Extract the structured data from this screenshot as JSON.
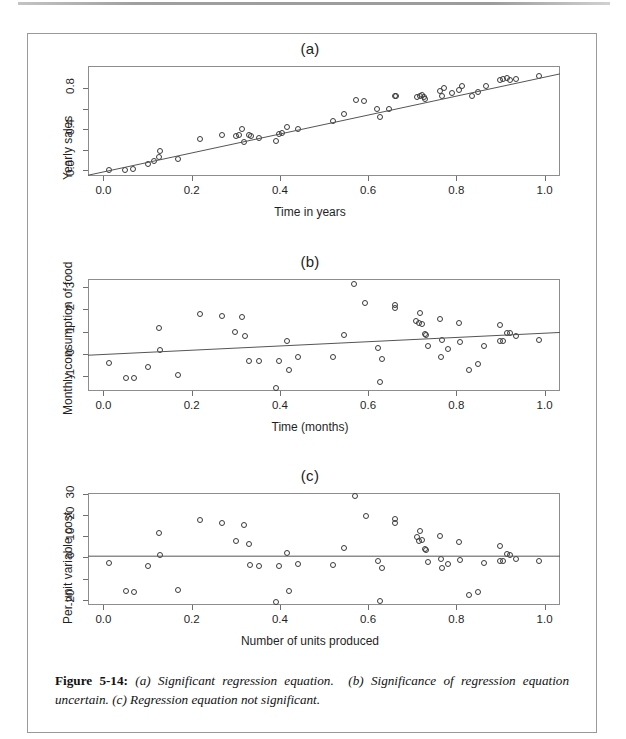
{
  "figure": {
    "caption_label": "Figure 5-14",
    "caption_sep": ":",
    "caption_a": "(a) Significant regression equation.",
    "caption_b": "(b) Significance of regression equation uncertain.",
    "caption_c": "(c) Regression equation not significant."
  },
  "chart_data": [
    {
      "type": "scatter",
      "title": "(a)",
      "xlabel": "Time in years",
      "ylabel": "Yearly sales",
      "xlim": [
        -0.035,
        1.035
      ],
      "ylim": [
        -0.06,
        1.02
      ],
      "xticks": [
        0.0,
        0.2,
        0.4,
        0.6,
        0.8,
        1.0
      ],
      "xticklabels": [
        "0.0",
        "0.2",
        "0.4",
        "0.6",
        "0.8",
        "1.0"
      ],
      "yticks": [
        0.0,
        0.4,
        0.8
      ],
      "yticklabels": [
        "0.0",
        "0.4",
        "0.8"
      ],
      "yminorticks": [
        0.2,
        0.6
      ],
      "grid": false,
      "legend": "none",
      "fit_line": {
        "intercept": -0.02,
        "slope": 0.93
      },
      "points": [
        [
          0.012,
          0.0
        ],
        [
          0.05,
          0.0
        ],
        [
          0.068,
          0.01
        ],
        [
          0.1,
          0.06
        ],
        [
          0.115,
          0.085
        ],
        [
          0.125,
          0.13
        ],
        [
          0.128,
          0.19
        ],
        [
          0.168,
          0.105
        ],
        [
          0.22,
          0.3
        ],
        [
          0.268,
          0.345
        ],
        [
          0.3,
          0.33
        ],
        [
          0.308,
          0.345
        ],
        [
          0.315,
          0.4
        ],
        [
          0.318,
          0.275
        ],
        [
          0.33,
          0.345
        ],
        [
          0.335,
          0.33
        ],
        [
          0.352,
          0.31
        ],
        [
          0.392,
          0.28
        ],
        [
          0.398,
          0.35
        ],
        [
          0.405,
          0.36
        ],
        [
          0.415,
          0.42
        ],
        [
          0.442,
          0.405
        ],
        [
          0.52,
          0.48
        ],
        [
          0.545,
          0.545
        ],
        [
          0.572,
          0.69
        ],
        [
          0.59,
          0.675
        ],
        [
          0.62,
          0.595
        ],
        [
          0.628,
          0.52
        ],
        [
          0.648,
          0.6
        ],
        [
          0.66,
          0.725
        ],
        [
          0.663,
          0.73
        ],
        [
          0.71,
          0.715
        ],
        [
          0.718,
          0.73
        ],
        [
          0.722,
          0.735
        ],
        [
          0.726,
          0.715
        ],
        [
          0.73,
          0.7
        ],
        [
          0.762,
          0.775
        ],
        [
          0.768,
          0.725
        ],
        [
          0.772,
          0.8
        ],
        [
          0.79,
          0.755
        ],
        [
          0.805,
          0.785
        ],
        [
          0.812,
          0.825
        ],
        [
          0.835,
          0.73
        ],
        [
          0.848,
          0.76
        ],
        [
          0.868,
          0.825
        ],
        [
          0.898,
          0.88
        ],
        [
          0.905,
          0.89
        ],
        [
          0.915,
          0.9
        ],
        [
          0.922,
          0.885
        ],
        [
          0.935,
          0.895
        ],
        [
          0.988,
          0.92
        ]
      ]
    },
    {
      "type": "scatter",
      "title": "(b)",
      "xlabel": "Time (months)",
      "ylabel": "Monthly consumption of food",
      "xlim": [
        -0.035,
        1.035
      ],
      "ylim": [
        -1.65,
        3.35
      ],
      "xticks": [
        0.0,
        0.2,
        0.4,
        0.6,
        0.8,
        1.0
      ],
      "xticklabels": [
        "0.0",
        "0.2",
        "0.4",
        "0.6",
        "0.8",
        "1.0"
      ],
      "yticks": [
        -1,
        0,
        1,
        2,
        3
      ],
      "yticklabels": [
        "-1",
        "0",
        "1",
        "2",
        "3"
      ],
      "grid": false,
      "legend": "none",
      "fit_line": {
        "intercept": -0.02,
        "slope": 0.95
      },
      "points": [
        [
          0.012,
          -0.42
        ],
        [
          0.052,
          -1.06
        ],
        [
          0.07,
          -1.08
        ],
        [
          0.1,
          -0.6
        ],
        [
          0.125,
          1.18
        ],
        [
          0.128,
          0.18
        ],
        [
          0.168,
          -0.92
        ],
        [
          0.22,
          1.8
        ],
        [
          0.268,
          1.72
        ],
        [
          0.298,
          0.98
        ],
        [
          0.315,
          1.66
        ],
        [
          0.322,
          0.82
        ],
        [
          0.33,
          -0.32
        ],
        [
          0.352,
          -0.32
        ],
        [
          0.392,
          -1.52
        ],
        [
          0.398,
          -0.3
        ],
        [
          0.415,
          0.56
        ],
        [
          0.42,
          -0.7
        ],
        [
          0.442,
          -0.12
        ],
        [
          0.52,
          -0.12
        ],
        [
          0.545,
          0.86
        ],
        [
          0.568,
          3.12
        ],
        [
          0.592,
          2.28
        ],
        [
          0.622,
          0.26
        ],
        [
          0.628,
          -1.24
        ],
        [
          0.632,
          -0.2
        ],
        [
          0.66,
          2.18
        ],
        [
          0.662,
          2.04
        ],
        [
          0.708,
          1.48
        ],
        [
          0.715,
          1.38
        ],
        [
          0.718,
          1.82
        ],
        [
          0.722,
          1.32
        ],
        [
          0.728,
          0.9
        ],
        [
          0.732,
          0.84
        ],
        [
          0.735,
          0.36
        ],
        [
          0.762,
          1.58
        ],
        [
          0.765,
          -0.14
        ],
        [
          0.768,
          0.62
        ],
        [
          0.782,
          0.24
        ],
        [
          0.805,
          1.4
        ],
        [
          0.808,
          0.52
        ],
        [
          0.828,
          -0.72
        ],
        [
          0.848,
          -0.44
        ],
        [
          0.862,
          0.36
        ],
        [
          0.898,
          1.3
        ],
        [
          0.9,
          0.58
        ],
        [
          0.905,
          0.6
        ],
        [
          0.915,
          0.92
        ],
        [
          0.922,
          0.96
        ],
        [
          0.935,
          0.82
        ],
        [
          0.988,
          0.62
        ]
      ]
    },
    {
      "type": "scatter",
      "title": "(c)",
      "xlabel": "Number of units produced",
      "ylabel": "Per unit variable cost",
      "xlim": [
        -0.035,
        1.035
      ],
      "ylim": [
        -22.5,
        30.5
      ],
      "xticks": [
        0.0,
        0.2,
        0.4,
        0.6,
        0.8,
        1.0
      ],
      "xticklabels": [
        "0.0",
        "0.2",
        "0.4",
        "0.6",
        "0.8",
        "1.0"
      ],
      "yticks": [
        -20,
        0,
        10,
        20,
        30
      ],
      "yticklabels": [
        "-20",
        "0",
        "10",
        "20",
        "30"
      ],
      "yminorticks": [
        -10
      ],
      "grid": false,
      "legend": "none",
      "fit_line": {
        "intercept": 0.6,
        "slope": 0.0
      },
      "points": [
        [
          0.012,
          -2.8
        ],
        [
          0.052,
          -15.8
        ],
        [
          0.07,
          -16.3
        ],
        [
          0.1,
          -4.2
        ],
        [
          0.125,
          11.4
        ],
        [
          0.128,
          1.0
        ],
        [
          0.168,
          -15.4
        ],
        [
          0.22,
          17.5
        ],
        [
          0.268,
          16.2
        ],
        [
          0.3,
          8.0
        ],
        [
          0.318,
          15.2
        ],
        [
          0.33,
          6.2
        ],
        [
          0.332,
          -3.6
        ],
        [
          0.352,
          -4.0
        ],
        [
          0.392,
          -21.3
        ],
        [
          0.398,
          -4.0
        ],
        [
          0.415,
          2.3
        ],
        [
          0.42,
          -15.8
        ],
        [
          0.442,
          -3.2
        ],
        [
          0.52,
          -3.6
        ],
        [
          0.545,
          4.3
        ],
        [
          0.57,
          29.0
        ],
        [
          0.595,
          19.4
        ],
        [
          0.622,
          -1.9
        ],
        [
          0.628,
          -20.6
        ],
        [
          0.632,
          -4.8
        ],
        [
          0.66,
          18.0
        ],
        [
          0.662,
          16.2
        ],
        [
          0.71,
          9.5
        ],
        [
          0.715,
          8.0
        ],
        [
          0.718,
          12.3
        ],
        [
          0.722,
          8.2
        ],
        [
          0.728,
          4.0
        ],
        [
          0.732,
          3.4
        ],
        [
          0.735,
          -2.1
        ],
        [
          0.762,
          10.0
        ],
        [
          0.765,
          -0.5
        ],
        [
          0.768,
          -5.0
        ],
        [
          0.782,
          -3.0
        ],
        [
          0.805,
          7.5
        ],
        [
          0.808,
          -1.4
        ],
        [
          0.828,
          -18.0
        ],
        [
          0.848,
          -16.5
        ],
        [
          0.862,
          -2.6
        ],
        [
          0.898,
          5.6
        ],
        [
          0.9,
          -1.8
        ],
        [
          0.905,
          -1.6
        ],
        [
          0.915,
          1.4
        ],
        [
          0.922,
          1.2
        ],
        [
          0.935,
          -0.5
        ],
        [
          0.988,
          -1.8
        ]
      ]
    }
  ]
}
